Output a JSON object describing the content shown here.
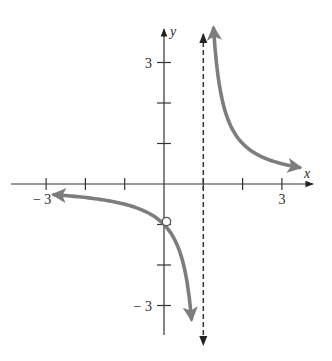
{
  "chart_data": {
    "type": "line",
    "title": "",
    "function": "y = 1/(x - 1)",
    "xlabel": "x",
    "ylabel": "y",
    "xlim": [
      -3.9,
      3.8
    ],
    "ylim": [
      -3.7,
      3.8
    ],
    "grid": false,
    "x_ticks": [
      -3,
      -2,
      -1,
      1,
      2,
      3
    ],
    "y_ticks": [
      -3,
      -2,
      -1,
      1,
      2,
      3
    ],
    "x_tick_labels": [
      {
        "value": -3,
        "label": "− 3"
      },
      {
        "value": 3,
        "label": "3"
      }
    ],
    "y_tick_labels": [
      {
        "value": 3,
        "label": "3"
      },
      {
        "value": -3,
        "label": "− 3"
      }
    ],
    "asymptotes": [
      {
        "type": "vertical",
        "x": 1,
        "style": "dashed"
      }
    ],
    "holes": [
      {
        "x": 0,
        "y": -1,
        "style": "open-circle"
      }
    ],
    "series": [
      {
        "name": "left-branch",
        "x": [
          -2.8,
          -2,
          -1,
          -0.5,
          0,
          0.25,
          0.5,
          0.6,
          0.7
        ],
        "y": [
          -0.263,
          -0.333,
          -0.5,
          -0.667,
          -1,
          -1.333,
          -2,
          -2.5,
          -3.333
        ],
        "arrows": "both-ends"
      },
      {
        "name": "right-branch",
        "x": [
          1.26,
          1.3,
          1.5,
          2,
          2.5,
          3,
          3.45
        ],
        "y": [
          3.85,
          3.333,
          2,
          1,
          0.667,
          0.5,
          0.408
        ],
        "arrows": "both-ends"
      }
    ],
    "colors": {
      "curve": "#7d7d7d",
      "axes": "#333333",
      "asymptote": "#333333"
    }
  }
}
